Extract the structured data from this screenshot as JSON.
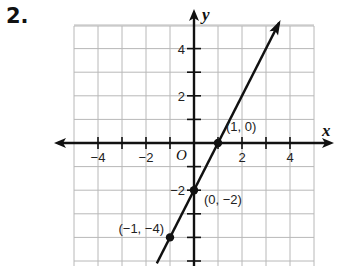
{
  "problem_number": "2.",
  "chart_data": {
    "type": "line",
    "title": "",
    "xlabel": "x",
    "ylabel": "y",
    "origin_label": "O",
    "xlim": [
      -5,
      5
    ],
    "ylim": [
      -5,
      5
    ],
    "grid": true,
    "x_ticks": [
      -4,
      -2,
      2,
      4
    ],
    "y_ticks": [
      4,
      2,
      -2
    ],
    "tick_labels": {
      "x": [
        "−4",
        "−2",
        "2",
        "4"
      ],
      "y": [
        "4",
        "2",
        "−2"
      ]
    },
    "line": {
      "equation": "y = 2x - 2",
      "slope": 2,
      "intercept": -2
    },
    "points": [
      {
        "x": 1,
        "y": 0,
        "label": "(1, 0)"
      },
      {
        "x": 0,
        "y": -2,
        "label": "(0, −2)"
      },
      {
        "x": -1,
        "y": -4,
        "label": "(−1, −4)"
      }
    ]
  },
  "colors": {
    "grid": "#b8b8b8",
    "axis": "#111111",
    "line": "#111111"
  }
}
